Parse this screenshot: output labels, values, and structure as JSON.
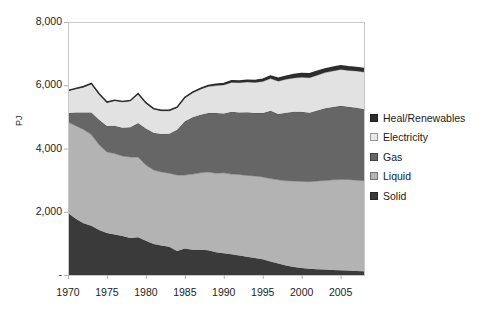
{
  "chart_data": {
    "type": "area",
    "stacked": true,
    "title": "",
    "subtitle": "",
    "xlabel": "",
    "ylabel": "PJ",
    "xlim": [
      1970,
      2008
    ],
    "ylim": [
      0,
      8000
    ],
    "grid": false,
    "legend_position": "right",
    "x": [
      1970,
      1971,
      1972,
      1973,
      1974,
      1975,
      1976,
      1977,
      1978,
      1979,
      1980,
      1981,
      1982,
      1983,
      1984,
      1985,
      1986,
      1987,
      1988,
      1989,
      1990,
      1991,
      1992,
      1993,
      1994,
      1995,
      1996,
      1997,
      1998,
      1999,
      2000,
      2001,
      2002,
      2003,
      2004,
      2005,
      2006,
      2007,
      2008
    ],
    "xtick_labels": [
      "1970",
      "1975",
      "1980",
      "1985",
      "1990",
      "1995",
      "2000",
      "2005"
    ],
    "xtick_values": [
      1970,
      1975,
      1980,
      1985,
      1990,
      1995,
      2000,
      2005
    ],
    "ytick_labels": [
      "-",
      "2,000",
      "4,000",
      "6,000",
      "8,000"
    ],
    "ytick_values": [
      0,
      2000,
      4000,
      6000,
      8000
    ],
    "series": [
      {
        "name": "Solid",
        "color": "#3a3a3a",
        "values": [
          1960,
          1780,
          1640,
          1560,
          1420,
          1330,
          1280,
          1230,
          1170,
          1190,
          1080,
          980,
          930,
          890,
          760,
          840,
          800,
          800,
          780,
          720,
          690,
          660,
          620,
          580,
          540,
          500,
          430,
          360,
          300,
          250,
          220,
          200,
          180,
          170,
          160,
          150,
          140,
          130,
          120
        ]
      },
      {
        "name": "Liquid",
        "color": "#b3b3b3",
        "values": [
          2880,
          2940,
          2960,
          2880,
          2700,
          2560,
          2560,
          2530,
          2560,
          2540,
          2400,
          2340,
          2330,
          2330,
          2400,
          2320,
          2390,
          2430,
          2480,
          2500,
          2540,
          2530,
          2560,
          2570,
          2590,
          2600,
          2620,
          2650,
          2680,
          2720,
          2740,
          2750,
          2790,
          2820,
          2850,
          2870,
          2880,
          2870,
          2860
        ]
      },
      {
        "name": "Gas",
        "color": "#666666",
        "values": [
          280,
          420,
          540,
          700,
          790,
          820,
          880,
          900,
          940,
          1080,
          1150,
          1180,
          1200,
          1250,
          1430,
          1700,
          1800,
          1840,
          1860,
          1900,
          1880,
          1970,
          1960,
          2000,
          1990,
          2020,
          2140,
          2080,
          2150,
          2190,
          2200,
          2180,
          2230,
          2280,
          2300,
          2330,
          2300,
          2290,
          2270
        ]
      },
      {
        "name": "Electricity",
        "color": "#e2e2e2",
        "values": [
          700,
          740,
          800,
          900,
          800,
          740,
          790,
          810,
          830,
          910,
          800,
          740,
          730,
          720,
          700,
          740,
          770,
          800,
          840,
          870,
          900,
          930,
          940,
          950,
          970,
          1000,
          1020,
          1040,
          1060,
          1070,
          1090,
          1110,
          1120,
          1130,
          1140,
          1150,
          1150,
          1160,
          1170
        ]
      },
      {
        "name": "Heat/Renewables",
        "color": "#2e2e2e",
        "values": [
          20,
          20,
          20,
          20,
          20,
          20,
          20,
          20,
          20,
          20,
          20,
          20,
          20,
          20,
          20,
          20,
          25,
          30,
          35,
          40,
          45,
          50,
          55,
          60,
          65,
          70,
          80,
          90,
          100,
          110,
          120,
          125,
          125,
          120,
          120,
          120,
          115,
          110,
          110
        ]
      }
    ],
    "totals": [
      5840,
      5900,
      5960,
      6060,
      5730,
      5470,
      5530,
      5490,
      5520,
      5740,
      5450,
      5260,
      5210,
      5190,
      5310,
      5620,
      5785,
      5900,
      5995,
      6030,
      6055,
      6140,
      6135,
      6160,
      6155,
      6190,
      6290,
      6220,
      6290,
      6340,
      6370,
      6365,
      6445,
      6520,
      6570,
      6620,
      6585,
      6560,
      6530
    ]
  },
  "legend": {
    "items": [
      {
        "label": "Heal/Renewables",
        "color": "#2e2e2e"
      },
      {
        "label": "Electricity",
        "color": "#e8e8e8"
      },
      {
        "label": "Gas",
        "color": "#666666"
      },
      {
        "label": "Liquid",
        "color": "#b3b3b3"
      },
      {
        "label": "Solid",
        "color": "#3a3a3a"
      }
    ]
  },
  "axes": {
    "y_title": "PJ",
    "plot_frame_color": "#c8c8c8"
  }
}
